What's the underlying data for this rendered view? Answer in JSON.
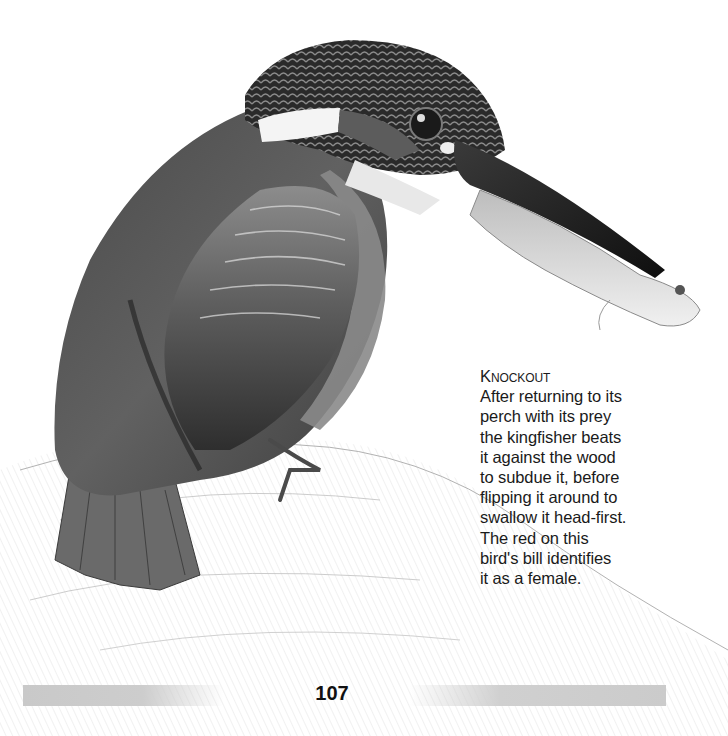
{
  "illustration": {
    "subject": "kingfisher-with-fish",
    "palette": {
      "head_dark": "#2b2b2b",
      "body_mid": "#5a5a5a",
      "wing_light": "#9a9a9a",
      "throat_white": "#f2f2f2",
      "bill_dark": "#151515",
      "fish_light": "#d8d8d8",
      "perch_sketch": "#9c9c9c"
    }
  },
  "caption": {
    "title": "Knockout",
    "lines": [
      "After returning to its",
      "perch with its prey",
      "the kingfisher beats",
      "it against the wood",
      "to subdue it, before",
      "flipping it around to",
      "swallow it head-first.",
      "The red on this",
      "bird's bill identifies",
      "it as a female."
    ]
  },
  "footer": {
    "page_number": "107",
    "bar_color": "#cbcbcb"
  }
}
